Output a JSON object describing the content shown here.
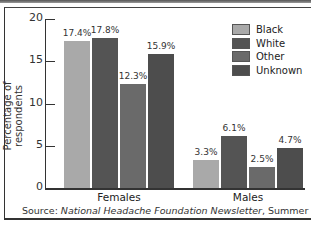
{
  "chart_data": {
    "type": "bar",
    "title": "",
    "xlabel": "",
    "ylabel": "Percentage of respondents",
    "ylim": [
      0,
      20
    ],
    "yticks": [
      0,
      5,
      10,
      15,
      20
    ],
    "categories": [
      "Females",
      "Males"
    ],
    "series": [
      {
        "name": "Black",
        "color": "#a9a9a9",
        "values": [
          17.4,
          3.3
        ],
        "labels": [
          "17.4%",
          "3.3%"
        ]
      },
      {
        "name": "White",
        "color": "#545454",
        "values": [
          17.8,
          6.1
        ],
        "labels": [
          "17.8%",
          "6.1%"
        ]
      },
      {
        "name": "Other",
        "color": "#6a6a6a",
        "values": [
          12.3,
          2.5
        ],
        "labels": [
          "12.3%",
          "2.5%"
        ]
      },
      {
        "name": "Unknown",
        "color": "#4d4d4d",
        "values": [
          15.9,
          4.7
        ],
        "labels": [
          "15.9%",
          "4.7%"
        ]
      }
    ],
    "legend_position": "top-right",
    "grid": false
  },
  "source": {
    "prefix": "Source: ",
    "publication": "National Headache Foundation Newsletter",
    "suffix": ", Summer 1992."
  }
}
